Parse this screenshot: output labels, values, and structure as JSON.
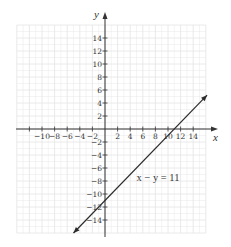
{
  "chart_data": {
    "type": "line",
    "title": "",
    "xlabel": "x",
    "ylabel": "y",
    "xlim": [
      -14,
      16
    ],
    "ylim": [
      -16,
      16
    ],
    "grid": true,
    "grid_step": 2,
    "x_ticks": [
      -12,
      -10,
      -8,
      -6,
      -4,
      -2,
      2,
      4,
      6,
      8,
      10,
      12,
      14
    ],
    "x_tick_labels": [
      "",
      "−10",
      "−8",
      "−6",
      "−4",
      "−2",
      "2",
      "4",
      "6",
      "8",
      "10",
      "12",
      "14"
    ],
    "y_ticks": [
      14,
      12,
      10,
      8,
      6,
      4,
      2,
      -2,
      -4,
      -6,
      -8,
      -10,
      -12,
      -14
    ],
    "y_tick_labels": [
      "14",
      "12",
      "10",
      "8",
      "6",
      "4",
      "2",
      "−2",
      "−4",
      "−6",
      "−8",
      "−10",
      "−12",
      "−14"
    ],
    "series": [
      {
        "name": "x − y = 11",
        "equation": "y = x − 11",
        "x": [
          -5,
          16.2
        ],
        "y": [
          -16,
          5.2
        ],
        "arrows": "both"
      }
    ],
    "annotations": [
      {
        "text": "x − y = 11",
        "x": 5,
        "y": -7.5
      }
    ],
    "legend": "none"
  },
  "colors": {
    "grid": "#e4e4e4",
    "axis": "#333333",
    "line": "#2b2b2b"
  }
}
